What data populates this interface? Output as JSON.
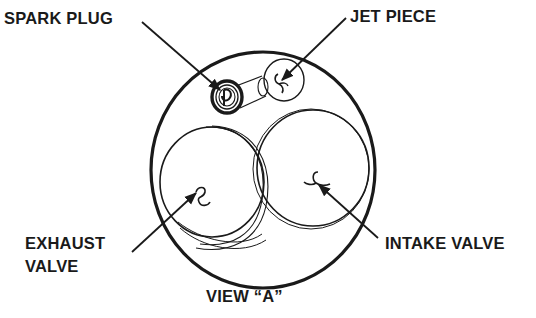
{
  "diagram": {
    "title": "VIEW “A”",
    "colors": {
      "ink": "#1a1a1a",
      "background": "#ffffff"
    },
    "labels": {
      "spark_plug": "SPARK PLUG",
      "jet_piece": "JET PIECE",
      "exhaust_valve_line1": "EXHAUST",
      "exhaust_valve_line2": "VALVE",
      "intake_valve": "INTAKE VALVE"
    },
    "components": [
      {
        "id": "spark-plug",
        "label": "SPARK PLUG"
      },
      {
        "id": "jet-piece",
        "label": "JET PIECE"
      },
      {
        "id": "exhaust-valve",
        "label": "EXHAUST VALVE"
      },
      {
        "id": "intake-valve",
        "label": "INTAKE VALVE"
      }
    ]
  }
}
